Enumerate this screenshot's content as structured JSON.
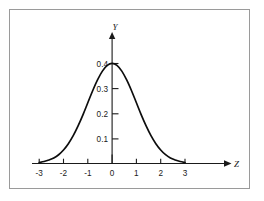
{
  "figure": {
    "background_color": "#ffffff",
    "frame_color": "#9a9a9a",
    "curve_color": "#0d0d0d",
    "axis_color": "#1a1a1a"
  },
  "chart_data": {
    "type": "line",
    "title": "",
    "xlabel": "Z",
    "ylabel": "Y",
    "xlim": [
      -3.55,
      3.9
    ],
    "ylim": [
      0,
      0.445
    ],
    "grid": false,
    "legend": null,
    "x_ticks": [
      -3,
      -2,
      -1,
      0,
      1,
      2,
      3
    ],
    "x_tick_labels": [
      "-3",
      "-2",
      "-1",
      "0",
      "1",
      "2",
      "3"
    ],
    "y_ticks": [
      0.1,
      0.2,
      0.3,
      0.4
    ],
    "y_tick_labels": [
      "0.1",
      "0.2",
      "0.3",
      "0.4"
    ],
    "series": [
      {
        "name": "standard normal density",
        "x": [
          -3,
          -2.8,
          -2.6,
          -2.4,
          -2.2,
          -2,
          -1.8,
          -1.6,
          -1.4,
          -1.2,
          -1,
          -0.8,
          -0.6,
          -0.4,
          -0.2,
          0,
          0.2,
          0.4,
          0.6,
          0.8,
          1,
          1.2,
          1.4,
          1.6,
          1.8,
          2,
          2.2,
          2.4,
          2.6,
          2.8,
          3
        ],
        "y": [
          0.004,
          0.008,
          0.014,
          0.022,
          0.035,
          0.054,
          0.079,
          0.111,
          0.15,
          0.194,
          0.242,
          0.29,
          0.333,
          0.368,
          0.391,
          0.399,
          0.391,
          0.368,
          0.333,
          0.29,
          0.242,
          0.194,
          0.15,
          0.111,
          0.079,
          0.054,
          0.035,
          0.022,
          0.014,
          0.008,
          0.004
        ]
      }
    ]
  },
  "axis_labels": {
    "x_title": "Z",
    "y_title": "Y"
  }
}
